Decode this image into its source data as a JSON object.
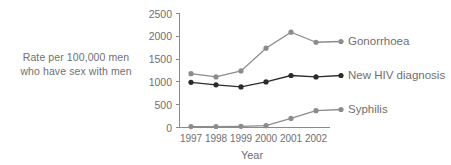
{
  "chart_data": {
    "type": "line",
    "title": "",
    "xlabel": "Year",
    "ylabel": "Rate per 100,000 men who have sex with men",
    "ylabel_line1": "Rate per 100,000 men",
    "ylabel_line2": "who have sex with men",
    "categories": [
      "1997",
      "1998",
      "1999",
      "2000",
      "2001",
      "2002"
    ],
    "x": [
      1997,
      1998,
      1999,
      2000,
      2001,
      2002
    ],
    "ylim": [
      0,
      2500
    ],
    "xlim": [
      1996.6,
      2002.4
    ],
    "yticks": [
      0,
      500,
      1000,
      1500,
      2000,
      2500
    ],
    "ytick_labels": [
      "0",
      "500",
      "1000",
      "1500",
      "2000",
      "2500"
    ],
    "grid": false,
    "legend_position": "right-inline-labels",
    "series": [
      {
        "name": "Gonorrhoea",
        "color": "#8c8c8c",
        "marker": "circle",
        "values": [
          1180,
          1110,
          1240,
          1740,
          2090,
          1870
        ]
      },
      {
        "name": "New HIV diagnosis",
        "color": "#2b2b2b",
        "marker": "circle",
        "values": [
          990,
          935,
          890,
          1000,
          1140,
          1110
        ]
      },
      {
        "name": "Syphilis",
        "color": "#8c8c8c",
        "marker": "circle",
        "values": [
          20,
          20,
          25,
          40,
          200,
          370
        ]
      }
    ]
  },
  "labels": {
    "gonorrhoea": "Gonorrhoea",
    "new_hiv": "New HIV diagnosis",
    "syphilis": "Syphilis"
  },
  "axis": {
    "x_title": "Year",
    "y_title_line1": "Rate per 100,000 men",
    "y_title_line2": "who have sex with men",
    "ytick_0": "0",
    "ytick_500": "500",
    "ytick_1000": "1000",
    "ytick_1500": "1500",
    "ytick_2000": "2000",
    "ytick_2500": "2500",
    "xtick_1997": "1997",
    "xtick_1998": "1998",
    "xtick_1999": "1999",
    "xtick_2000": "2000",
    "xtick_2001": "2001",
    "xtick_2002": "2002"
  },
  "colors": {
    "gonorrhoea": "#8c8c8c",
    "new_hiv": "#2b2b2b",
    "syphilis": "#8c8c8c",
    "axis": "#8a8a8a",
    "text": "#6f6f6f",
    "background": "#ffffff"
  }
}
